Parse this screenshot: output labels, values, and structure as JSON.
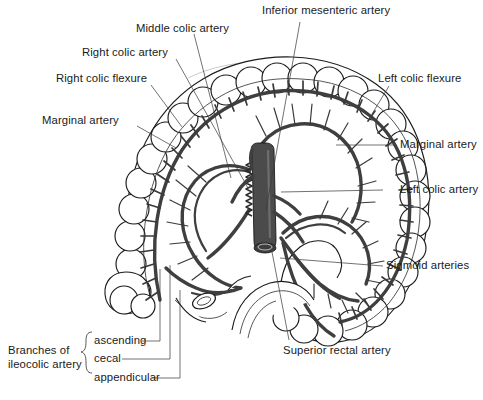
{
  "figure": {
    "type": "anatomical-illustration",
    "background_color": "#ffffff",
    "ink_color": "#1a1a1a",
    "vessel_color": "#3f3f3f"
  },
  "labels": {
    "inferior_mesenteric_artery": "Inferior mesenteric artery",
    "middle_colic_artery": "Middle colic artery",
    "right_colic_artery": "Right colic artery",
    "right_colic_flexure": "Right colic flexure",
    "marginal_artery_left_side": "Marginal artery",
    "left_colic_flexure": "Left colic flexure",
    "marginal_artery_right_side": "Marginal artery",
    "left_colic_artery": "Left colic artery",
    "sigmoid_arteries": "Sigmoid arteries",
    "superior_rectal_artery": "Superior rectal artery",
    "branches_group_line1": "Branches of",
    "branches_group_line2": "ileocolic artery",
    "branch_ascending": "ascending",
    "branch_cecal": "cecal",
    "branch_appendicular": "appendicular"
  }
}
